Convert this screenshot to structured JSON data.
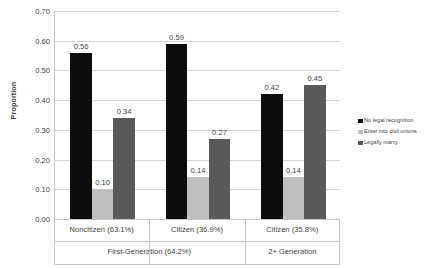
{
  "chart_data": {
    "type": "bar",
    "title": "",
    "xlabel": "",
    "ylabel": "Proportion",
    "ylim": [
      0,
      0.7
    ],
    "ytick_labels": [
      "0.00",
      "0.10",
      "0.20",
      "0.30",
      "0.40",
      "0.50",
      "0.60",
      "0.70"
    ],
    "ytick_values": [
      0.0,
      0.1,
      0.2,
      0.3,
      0.4,
      0.5,
      0.6,
      0.7
    ],
    "grid": true,
    "legend_position": "right",
    "categories": [
      "Noncitizen (63.1%)",
      "Citizen (36.9%)",
      "Citizen (35.8%)"
    ],
    "group_labels": [
      "First-Generation (64.2%)",
      "2+ Generation"
    ],
    "series": [
      {
        "name": "No legal recognition",
        "color": "#0d0d0d",
        "values": [
          0.56,
          0.59,
          0.42
        ],
        "labels": [
          "0.56",
          "0.59",
          "0.42"
        ]
      },
      {
        "name": "Enter into civil unions",
        "color": "#bfbfbf",
        "values": [
          0.1,
          0.14,
          0.14
        ],
        "labels": [
          "0.10",
          "0.14",
          "0.14"
        ]
      },
      {
        "name": "Legally marry",
        "color": "#595959",
        "values": [
          0.34,
          0.27,
          0.45
        ],
        "labels": [
          "0.34",
          "0.27",
          "0.45"
        ]
      }
    ]
  },
  "legend": {
    "items": [
      {
        "label": "No legal recognition",
        "color": "#0d0d0d"
      },
      {
        "label": "Enter into civil unions",
        "color": "#bfbfbf"
      },
      {
        "label": "Legally marry",
        "color": "#595959"
      }
    ]
  },
  "axes": {
    "y_title": "Proportion"
  }
}
